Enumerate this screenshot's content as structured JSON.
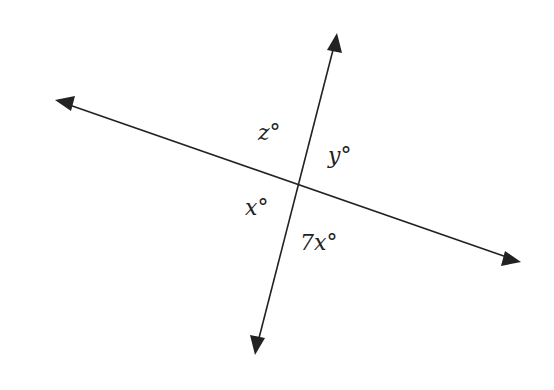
{
  "diagram": {
    "lines": [
      {
        "name": "line-a",
        "from": [
          55,
          100
        ],
        "to": [
          521,
          262
        ]
      },
      {
        "name": "line-b",
        "from": [
          337,
          33
        ],
        "to": [
          255,
          355
        ]
      }
    ],
    "intersection": [
      298,
      185
    ],
    "labels": {
      "z": "z°",
      "y": "y°",
      "x": "x°",
      "seven_x": "7x°"
    },
    "colors": {
      "line": "#222222",
      "background": "#ffffff"
    }
  }
}
